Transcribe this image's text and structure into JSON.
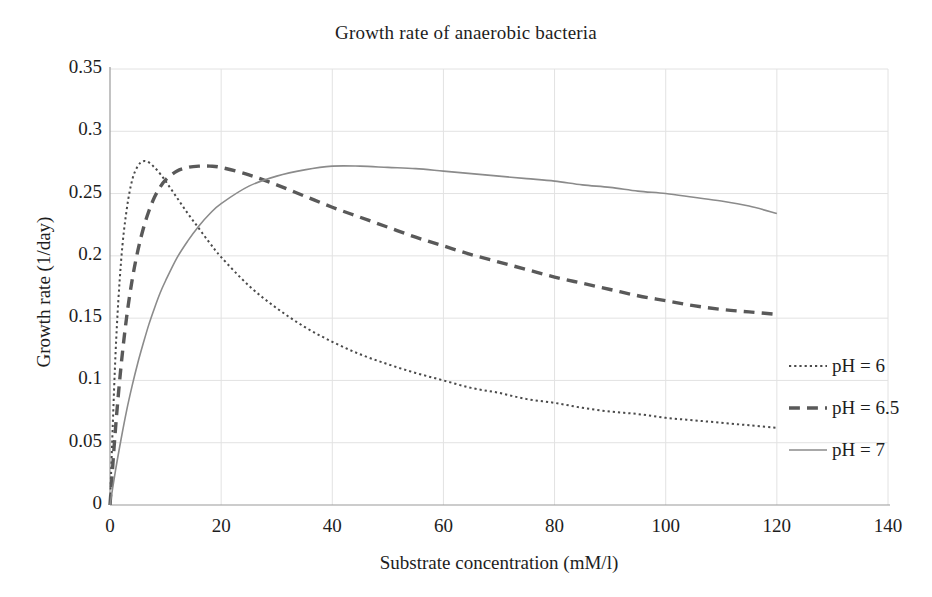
{
  "chart_data": {
    "type": "line",
    "title": "Growth rate of anaerobic bacteria",
    "xlabel": "Substrate concentration (mM/l)",
    "ylabel": "Growth rate (1/day)",
    "xlim": [
      0,
      140
    ],
    "ylim": [
      0,
      0.35
    ],
    "xticks": [
      0,
      20,
      40,
      60,
      80,
      100,
      120,
      140
    ],
    "xticklabels": [
      "0",
      "20",
      "40",
      "60",
      "80",
      "100",
      "120",
      "140"
    ],
    "yticks": [
      0,
      0.05,
      0.1,
      0.15,
      0.2,
      0.25,
      0.3,
      0.35
    ],
    "yticklabels": [
      "0",
      "0.05",
      "0.1",
      "0.15",
      "0.2",
      "0.25",
      "0.3",
      "0.35"
    ],
    "grid": true,
    "grid_color": "#e2e2e2",
    "legend_position": "right",
    "axis_color": "#9a9a9a",
    "x": [
      0,
      1,
      2,
      3,
      4,
      5,
      6,
      7,
      8,
      9,
      10,
      12,
      14,
      16,
      18,
      20,
      25,
      30,
      35,
      40,
      45,
      50,
      55,
      60,
      65,
      70,
      75,
      80,
      85,
      90,
      95,
      100,
      105,
      110,
      115,
      120
    ],
    "series": [
      {
        "name": "pH = 6",
        "label": "pH = 6",
        "style": "dotted",
        "color": "#4a4a4a",
        "width": 2.0,
        "peak_x": 6,
        "peak_y": 0.276,
        "end_y": 0.082,
        "values": [
          0.0,
          0.122,
          0.196,
          0.237,
          0.261,
          0.272,
          0.276,
          0.275,
          0.271,
          0.266,
          0.26,
          0.247,
          0.234,
          0.222,
          0.21,
          0.199,
          0.176,
          0.158,
          0.143,
          0.131,
          0.121,
          0.113,
          0.106,
          0.1,
          0.094,
          0.09,
          0.085,
          0.082,
          0.078,
          0.075,
          0.073,
          0.07,
          0.068,
          0.066,
          0.064,
          0.062
        ]
      },
      {
        "name": "pH = 6.5",
        "label": "pH = 6.5",
        "style": "dashed",
        "color": "#595959",
        "width": 3.4,
        "peak_x": 18,
        "peak_y": 0.272,
        "end_y": 0.153,
        "values": [
          0.0,
          0.062,
          0.112,
          0.151,
          0.181,
          0.204,
          0.222,
          0.236,
          0.247,
          0.255,
          0.261,
          0.268,
          0.271,
          0.272,
          0.272,
          0.271,
          0.265,
          0.257,
          0.248,
          0.239,
          0.231,
          0.223,
          0.215,
          0.208,
          0.201,
          0.195,
          0.189,
          0.183,
          0.178,
          0.173,
          0.168,
          0.164,
          0.16,
          0.157,
          0.155,
          0.153
        ]
      },
      {
        "name": "pH = 7",
        "label": "pH = 7",
        "style": "solid",
        "color": "#8b8b8b",
        "width": 1.6,
        "peak_x": 42,
        "peak_y": 0.272,
        "end_y": 0.234,
        "values": [
          0.0,
          0.028,
          0.053,
          0.076,
          0.096,
          0.114,
          0.13,
          0.145,
          0.158,
          0.17,
          0.18,
          0.198,
          0.212,
          0.224,
          0.234,
          0.242,
          0.256,
          0.264,
          0.269,
          0.272,
          0.272,
          0.271,
          0.27,
          0.268,
          0.266,
          0.264,
          0.262,
          0.26,
          0.257,
          0.255,
          0.252,
          0.25,
          0.247,
          0.244,
          0.24,
          0.234
        ]
      }
    ]
  },
  "legend": {
    "items": [
      {
        "label": "pH = 6",
        "style": "dotted"
      },
      {
        "label": "pH = 6.5",
        "style": "dashed"
      },
      {
        "label": "pH = 7",
        "style": "solid"
      }
    ]
  }
}
